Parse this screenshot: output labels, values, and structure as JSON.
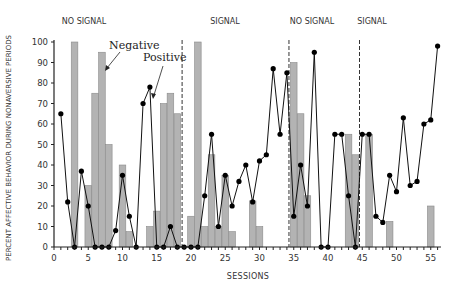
{
  "chart_data": {
    "type": "bar",
    "title": "",
    "xlabel": "SESSIONS",
    "ylabel": "PERCENT AFFECTIVE BEHAVIOR DURING NONAVERSIVE PERIODS",
    "xlim": [
      0,
      57
    ],
    "ylim": [
      0,
      100
    ],
    "x_ticks": [
      0,
      5,
      10,
      15,
      20,
      25,
      30,
      35,
      40,
      45,
      50,
      55
    ],
    "y_ticks": [
      0,
      10,
      20,
      30,
      40,
      50,
      60,
      70,
      80,
      90,
      100
    ],
    "grid": false,
    "phases": [
      {
        "label": "NO SIGNAL",
        "start": 0.5,
        "end": 18.7
      },
      {
        "label": "SIGNAL",
        "start": 18.7,
        "end": 34.3
      },
      {
        "label": "NO SIGNAL",
        "start": 34.3,
        "end": 44.6
      },
      {
        "label": "SIGNAL",
        "start": 44.6,
        "end": 56.5
      }
    ],
    "phase_dividers": [
      18.7,
      34.3,
      44.6
    ],
    "annotations": [
      {
        "text": "Negative",
        "points_to": "bars"
      },
      {
        "text": "Positive",
        "points_to": "line"
      }
    ],
    "series": [
      {
        "name": "Negative",
        "type": "bar",
        "color": "#b3b3b3",
        "x": [
          3,
          5,
          6,
          7,
          8,
          10,
          11,
          14,
          15,
          16,
          17,
          18,
          20,
          21,
          22,
          23,
          24,
          25,
          26,
          29,
          30,
          35,
          36,
          37,
          43,
          44,
          46,
          49,
          55
        ],
        "values": [
          100,
          30,
          75,
          95,
          50,
          40,
          7.5,
          10,
          17.5,
          70,
          75,
          65,
          15,
          100,
          10,
          45,
          10,
          35,
          7.5,
          22.5,
          10,
          90,
          65,
          25,
          55,
          45,
          55,
          12.5,
          20
        ]
      },
      {
        "name": "Positive",
        "type": "line",
        "color": "#111111",
        "x": [
          1,
          2,
          3,
          4,
          5,
          6,
          7,
          8,
          9,
          10,
          11,
          12,
          13,
          14,
          15,
          16,
          17,
          18,
          19,
          20,
          21,
          22,
          23,
          24,
          25,
          26,
          27,
          28,
          29,
          30,
          31,
          32,
          33,
          34,
          35,
          36,
          37,
          38,
          39,
          40,
          41,
          42,
          43,
          44,
          45,
          46,
          47,
          48,
          49,
          50,
          51,
          52,
          53,
          54,
          55,
          56
        ],
        "values": [
          65,
          22,
          0,
          37,
          20,
          0,
          0,
          0,
          8,
          35,
          15,
          0,
          70,
          78,
          0,
          0,
          10,
          0,
          0,
          0,
          0,
          25,
          55,
          10,
          35,
          20,
          32,
          40,
          22,
          42,
          45,
          87,
          55,
          85,
          15,
          40,
          20,
          95,
          0,
          0,
          55,
          55,
          25,
          0,
          55,
          55,
          15,
          12,
          35,
          27,
          63,
          30,
          32,
          60,
          62,
          98
        ]
      }
    ]
  }
}
